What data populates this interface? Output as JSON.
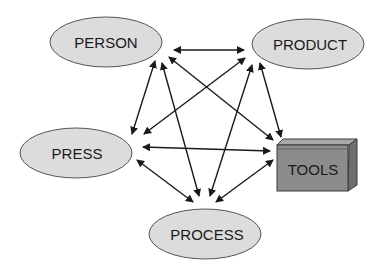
{
  "diagram": {
    "nodes": [
      {
        "id": "person",
        "label": "PERSON",
        "shape": "ellipse",
        "cx": 106,
        "cy": 42,
        "rx": 56,
        "ry": 25
      },
      {
        "id": "product",
        "label": "PRODUCT",
        "shape": "ellipse",
        "cx": 308,
        "cy": 44,
        "rx": 56,
        "ry": 25
      },
      {
        "id": "press",
        "label": "PRESS",
        "shape": "ellipse",
        "cx": 76,
        "cy": 153,
        "rx": 56,
        "ry": 25
      },
      {
        "id": "tools",
        "label": "TOOLS",
        "shape": "box"
      },
      {
        "id": "process",
        "label": "PROCESS",
        "shape": "ellipse",
        "cx": 205,
        "cy": 234,
        "rx": 56,
        "ry": 25
      }
    ],
    "edges": [
      {
        "from": "person",
        "to": "product",
        "direction": "both"
      },
      {
        "from": "person",
        "to": "press",
        "direction": "both"
      },
      {
        "from": "person",
        "to": "process",
        "direction": "both"
      },
      {
        "from": "person",
        "to": "tools",
        "direction": "both"
      },
      {
        "from": "product",
        "to": "press",
        "direction": "both"
      },
      {
        "from": "product",
        "to": "process",
        "direction": "both"
      },
      {
        "from": "product",
        "to": "tools",
        "direction": "both"
      },
      {
        "from": "press",
        "to": "tools",
        "direction": "both"
      },
      {
        "from": "press",
        "to": "process",
        "direction": "both"
      },
      {
        "from": "process",
        "to": "tools",
        "direction": "both"
      }
    ],
    "colors": {
      "ellipse_fill": "#dcdcdc",
      "ellipse_stroke": "#555555",
      "box_front": "#8c8c8c",
      "box_top": "#a8a8a8",
      "box_side": "#6e6e6e",
      "arrow": "#1a1a1a"
    }
  }
}
